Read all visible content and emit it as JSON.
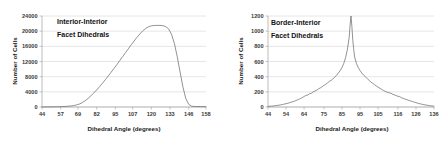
{
  "figure": {
    "panels": [
      "left",
      "right"
    ]
  },
  "chart_data": [
    {
      "type": "line",
      "panel": "left",
      "title": "",
      "annotation_lines": [
        "Interior-Interior",
        "Facet Dihedrals"
      ],
      "xlabel": "Dihedral Angle (degrees)",
      "ylabel": "Number of Cells",
      "xlim": [
        44,
        158
      ],
      "ylim": [
        0,
        24000
      ],
      "grid": "horizontal",
      "legend": "none",
      "xticks": [
        44,
        57,
        69,
        82,
        95,
        107,
        120,
        133,
        146,
        158
      ],
      "yticks": [
        0,
        4000,
        8000,
        12000,
        16000,
        20000,
        24000
      ],
      "x": [
        44,
        46,
        48,
        50,
        52,
        54,
        56,
        58,
        60,
        62,
        64,
        66,
        68,
        70,
        72,
        74,
        76,
        78,
        80,
        82,
        84,
        86,
        88,
        90,
        92,
        94,
        96,
        98,
        100,
        102,
        104,
        106,
        108,
        110,
        112,
        114,
        116,
        118,
        120,
        122,
        124,
        126,
        128,
        130,
        132,
        134,
        136,
        138,
        140,
        142,
        144,
        146,
        148,
        150,
        152,
        154,
        156,
        158
      ],
      "values": [
        20,
        25,
        30,
        40,
        50,
        65,
        85,
        110,
        150,
        200,
        270,
        380,
        540,
        780,
        1150,
        1650,
        2250,
        2950,
        3700,
        4500,
        5350,
        6250,
        7200,
        8150,
        9150,
        10150,
        11150,
        12200,
        13250,
        14300,
        15350,
        16400,
        17400,
        18350,
        19250,
        20050,
        20700,
        21150,
        21400,
        21500,
        21530,
        21520,
        21450,
        21200,
        20600,
        19200,
        16800,
        13300,
        9200,
        5200,
        2200,
        700,
        230,
        140,
        120,
        110,
        105,
        100
      ]
    },
    {
      "type": "line",
      "panel": "right",
      "title": "",
      "annotation_lines": [
        "Border-Interior",
        "Facet Dihedrals"
      ],
      "xlabel": "Dihedral Angle (degrees)",
      "ylabel": "Number of Cells",
      "xlim": [
        44,
        136
      ],
      "ylim": [
        0,
        1200
      ],
      "grid": "horizontal",
      "legend": "none",
      "xticks": [
        44,
        54,
        64,
        75,
        85,
        95,
        105,
        116,
        126,
        136
      ],
      "yticks": [
        0,
        200,
        400,
        600,
        800,
        1000,
        1200
      ],
      "x": [
        44,
        45,
        46,
        47,
        48,
        49,
        50,
        51,
        52,
        53,
        54,
        55,
        56,
        57,
        58,
        59,
        60,
        61,
        62,
        63,
        64,
        65,
        66,
        67,
        68,
        69,
        70,
        71,
        72,
        73,
        74,
        75,
        76,
        77,
        78,
        79,
        80,
        81,
        82,
        83,
        84,
        85,
        86,
        87,
        88,
        89,
        89.5,
        90,
        90.5,
        91,
        91.5,
        92,
        93,
        94,
        95,
        96,
        97,
        98,
        99,
        100,
        101,
        102,
        103,
        104,
        105,
        106,
        107,
        108,
        109,
        110,
        111,
        112,
        113,
        114,
        115,
        116,
        117,
        118,
        119,
        120,
        121,
        122,
        123,
        124,
        125,
        126,
        127,
        128,
        129,
        130,
        131,
        132,
        133,
        134,
        135,
        136
      ],
      "values": [
        8,
        10,
        12,
        14,
        17,
        20,
        24,
        28,
        33,
        38,
        44,
        50,
        57,
        64,
        72,
        80,
        90,
        100,
        112,
        124,
        138,
        152,
        158,
        175,
        182,
        200,
        210,
        222,
        240,
        252,
        268,
        285,
        300,
        318,
        338,
        350,
        372,
        395,
        418,
        448,
        480,
        520,
        575,
        650,
        760,
        920,
        1080,
        1200,
        1060,
        880,
        760,
        660,
        575,
        520,
        480,
        448,
        420,
        398,
        375,
        352,
        330,
        312,
        295,
        278,
        262,
        248,
        232,
        218,
        205,
        195,
        188,
        182,
        170,
        160,
        150,
        142,
        135,
        122,
        112,
        105,
        96,
        88,
        80,
        72,
        65,
        58,
        50,
        44,
        38,
        33,
        28,
        24,
        20,
        17,
        14,
        11,
        9
      ]
    }
  ]
}
